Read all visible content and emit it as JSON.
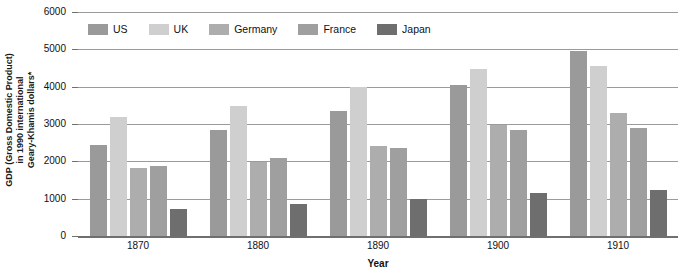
{
  "chart_data": {
    "type": "bar",
    "title": "",
    "xlabel": "Year",
    "ylabel": "GDP (Gross Domestic Product) in 1990 international Geary-Khamis dollars*",
    "ylabel_lines": [
      "GDP (Gross Domestic Product)",
      "in 1990 international",
      "Geary-Khamis dollars*"
    ],
    "categories": [
      "1870",
      "1880",
      "1890",
      "1900",
      "1910"
    ],
    "ylim": [
      0,
      6000
    ],
    "ytick_step": 1000,
    "yticks": [
      "6000",
      "5000",
      "4000",
      "3000",
      "2000",
      "1000",
      "0"
    ],
    "grid": true,
    "legend_position": "top",
    "series": [
      {
        "name": "US",
        "color": "#9a9a9a",
        "values": [
          2450,
          2850,
          3350,
          4050,
          4950
        ]
      },
      {
        "name": "UK",
        "color": "#cfcfcf",
        "values": [
          3180,
          3480,
          4000,
          4480,
          4560
        ]
      },
      {
        "name": "Germany",
        "color": "#adadad",
        "values": [
          1830,
          1990,
          2400,
          2980,
          3290
        ]
      },
      {
        "name": "France",
        "color": "#9f9f9f",
        "values": [
          1880,
          2100,
          2370,
          2840,
          2900
        ]
      },
      {
        "name": "Japan",
        "color": "#6e6e6e",
        "values": [
          730,
          850,
          1000,
          1150,
          1240
        ]
      }
    ]
  }
}
